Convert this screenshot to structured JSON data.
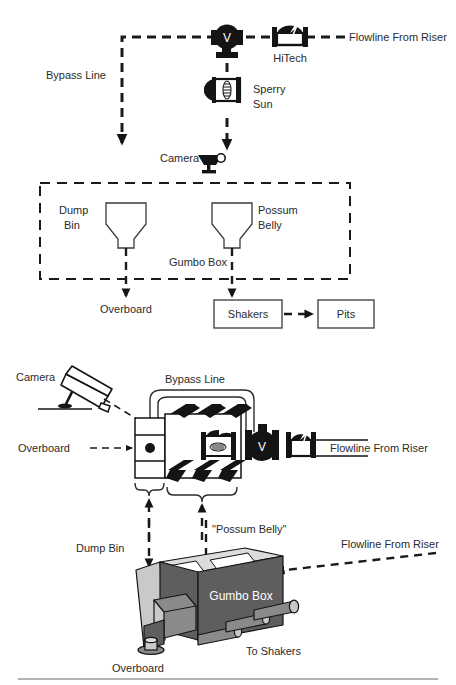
{
  "figure": {
    "background": "#ffffff",
    "ink": "#1a1a1a"
  },
  "top_diagram": {
    "name": "schematic-flow-diagram",
    "labels": {
      "bypass_line": "Bypass Line",
      "flowline_from_riser": "Flowline From Riser",
      "hitech": "HiTech",
      "sperry_sun": "Sperry\nSun",
      "sperry_sun_line1": "Sperry",
      "sperry_sun_line2": "Sun",
      "camera": "Camera",
      "dump_bin_line1": "Dump",
      "dump_bin_line2": "Bin",
      "possum_belly_line1": "Possum",
      "possum_belly_line2": "Belly",
      "gumbo_box": "Gumbo Box",
      "overboard": "Overboard",
      "shakers": "Shakers",
      "pits": "Pits",
      "valve_symbol": "V"
    },
    "icons": [
      "valve-icon",
      "hitech-meter-icon",
      "sperry-sun-sensor-icon",
      "camera-icon",
      "dump-bin-funnel-icon",
      "possum-belly-funnel-icon"
    ],
    "boxes": [
      {
        "label": "Shakers"
      },
      {
        "label": "Pits"
      }
    ]
  },
  "bottom_diagram": {
    "name": "pictorial-equipment-diagram",
    "labels": {
      "camera": "Camera",
      "bypass_line": "Bypass Line",
      "overboard_pipe": "Overboard",
      "flowline_from_riser_pipe": "Flowline From Riser",
      "dump_bin": "Dump Bin",
      "possum_belly": "\"Possum Belly\"",
      "flowline_from_riser_box": "Flowline From Riser",
      "gumbo_box": "Gumbo Box",
      "overboard_box": "Overboard",
      "to_shakers": "To Shakers",
      "valve_symbol": "V"
    },
    "icons": [
      "camera-icon",
      "valve-icon",
      "hitech-meter-icon",
      "sperry-sun-sensor-icon",
      "gumbo-box-3d-icon",
      "brace-dump-bin",
      "brace-possum-belly"
    ],
    "colors": {
      "box_face_dark": "#5e5e5e",
      "box_face_mid": "#8a8a8a",
      "box_face_light": "#c9c9c9",
      "box_top_light": "#dcdcdc",
      "label_on_box": "#ffffff"
    }
  }
}
